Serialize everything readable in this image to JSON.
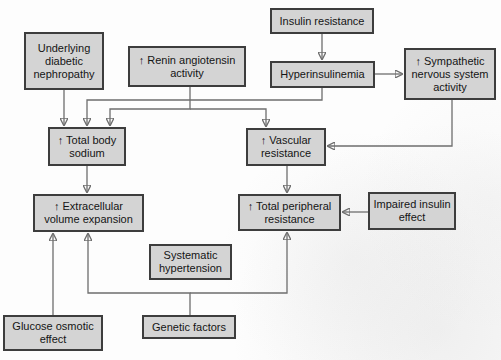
{
  "diagram": {
    "type": "flowchart",
    "nodes": {
      "nephropathy": {
        "label": "Underlying\ndiabetic\nnephropathy"
      },
      "renin": {
        "label": "↑ Renin angiotensin\nactivity"
      },
      "insulin_resistance": {
        "label": "Insulin resistance"
      },
      "hyperinsulinemia": {
        "label": "Hyperinsulinemia"
      },
      "sympathetic": {
        "label": "↑ Sympathetic\nnervous system\nactivity"
      },
      "total_body_sodium": {
        "label": "↑ Total body\nsodium"
      },
      "vascular_resistance": {
        "label": "↑ Vascular\nresistance"
      },
      "extracellular": {
        "label": "↑ Extracellular\nvolume expansion"
      },
      "total_peripheral": {
        "label": "↑ Total peripheral\nresistance"
      },
      "impaired_insulin": {
        "label": "Impaired insulin\neffect"
      },
      "systematic_hypertension": {
        "label": "Systematic\nhypertension"
      },
      "glucose_osmotic": {
        "label": "Glucose osmotic\neffect"
      },
      "genetic_factors": {
        "label": "Genetic factors"
      }
    },
    "edges": [
      {
        "from": "Underlying diabetic nephropathy",
        "to": "Total body sodium"
      },
      {
        "from": "Insulin resistance",
        "to": "Hyperinsulinemia"
      },
      {
        "from": "Hyperinsulinemia",
        "to": "Sympathetic nervous system activity"
      },
      {
        "from": "Hyperinsulinemia",
        "to": "Total body sodium"
      },
      {
        "from": "Renin angiotensin activity",
        "to": "Total body sodium"
      },
      {
        "from": "Renin angiotensin activity",
        "to": "Vascular resistance"
      },
      {
        "from": "Sympathetic nervous system activity",
        "to": "Vascular resistance"
      },
      {
        "from": "Total body sodium",
        "to": "Extracellular volume expansion"
      },
      {
        "from": "Vascular resistance",
        "to": "Total peripheral resistance"
      },
      {
        "from": "Impaired insulin effect",
        "to": "Total peripheral resistance"
      },
      {
        "from": "Glucose osmotic effect",
        "to": "Extracellular volume expansion"
      },
      {
        "from": "Genetic factors",
        "to": "Extracellular volume expansion"
      },
      {
        "from": "Genetic factors",
        "to": "Total peripheral resistance"
      }
    ],
    "colors": {
      "box_fill": "#d4d4d4",
      "box_border": "#3d3d3d",
      "line": "#6e6e6e",
      "arrowhead": "#111111",
      "text": "#151515",
      "background": "#fdfdfd"
    }
  }
}
